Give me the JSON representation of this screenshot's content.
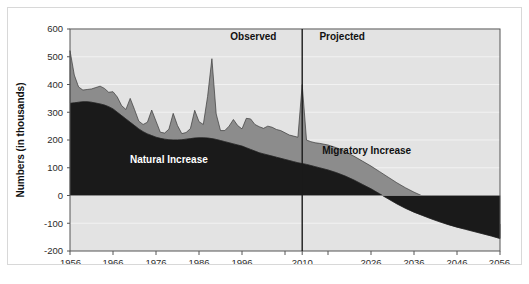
{
  "figure": {
    "caption": "",
    "y_axis_title": "Numbers (in thousands)",
    "period_labels": {
      "observed": "Observed",
      "projected": "Projected"
    },
    "series_labels": {
      "natural": "Natural Increase",
      "migratory": "Migratory Increase"
    },
    "colors": {
      "natural_fill": "#1a1a1a",
      "migratory_fill": "#8c8c8c",
      "plot_background": "#e3e3e3",
      "gridline": "#f2f2f2",
      "axis_line": "#555555",
      "divider_line": "#1a1a1a",
      "frame_border": "#d8d8d8",
      "text": "#1a1a1a",
      "natural_label_text": "#ffffff",
      "migratory_label_text": "#111111"
    }
  },
  "chart_data": {
    "type": "area",
    "stacked": true,
    "title": "",
    "xlabel": "",
    "ylabel": "Numbers (in thousands)",
    "xlim": [
      1956,
      2056
    ],
    "ylim": [
      -200,
      600
    ],
    "yticks": [
      -200,
      -100,
      0,
      100,
      200,
      300,
      400,
      500,
      600
    ],
    "ytick_labels": [
      "-200",
      "-100",
      "0",
      "100",
      "200",
      "300",
      "400",
      "500",
      "600"
    ],
    "xticks": [
      1956,
      1966,
      1976,
      1986,
      1996,
      2006,
      2010,
      2016,
      2026,
      2036,
      2046,
      2056
    ],
    "xtick_labels": [
      "1956",
      "1966",
      "1976",
      "1986",
      "1996",
      "",
      "2010",
      "",
      "2026",
      "2036",
      "2046",
      "2056"
    ],
    "grid": true,
    "legend_position": "inline-annotations",
    "divider_x": 2010,
    "annotations": [
      {
        "text": "Observed",
        "x": 2004,
        "y": 560,
        "align": "end"
      },
      {
        "text": "Projected",
        "x": 2014,
        "y": 560,
        "align": "start"
      },
      {
        "text": "Natural Increase",
        "x": 1979,
        "y": 118,
        "align": "middle"
      },
      {
        "text": "Migratory Increase",
        "x": 2025,
        "y": 148,
        "align": "middle"
      }
    ],
    "series": [
      {
        "name": "Natural Increase",
        "color": "#1a1a1a",
        "x": [
          1956,
          1957,
          1958,
          1959,
          1960,
          1961,
          1962,
          1963,
          1964,
          1965,
          1966,
          1967,
          1968,
          1969,
          1970,
          1971,
          1972,
          1973,
          1974,
          1975,
          1976,
          1977,
          1978,
          1979,
          1980,
          1981,
          1982,
          1983,
          1984,
          1985,
          1986,
          1987,
          1988,
          1989,
          1990,
          1991,
          1992,
          1993,
          1994,
          1995,
          1996,
          1997,
          1998,
          1999,
          2000,
          2001,
          2002,
          2003,
          2004,
          2005,
          2006,
          2007,
          2008,
          2009,
          2010,
          2011,
          2012,
          2013,
          2014,
          2016,
          2018,
          2020,
          2022,
          2024,
          2026,
          2028,
          2030,
          2032,
          2034,
          2036,
          2038,
          2040,
          2042,
          2044,
          2046,
          2048,
          2050,
          2052,
          2054,
          2056
        ],
        "values": [
          332,
          334,
          336,
          338,
          338,
          336,
          333,
          330,
          326,
          320,
          312,
          300,
          288,
          276,
          264,
          252,
          240,
          230,
          222,
          216,
          210,
          206,
          203,
          201,
          200,
          200,
          201,
          203,
          205,
          207,
          208,
          208,
          207,
          205,
          202,
          198,
          194,
          190,
          186,
          182,
          178,
          172,
          166,
          160,
          154,
          150,
          146,
          142,
          138,
          134,
          130,
          126,
          122,
          118,
          115,
          112,
          108,
          104,
          100,
          92,
          82,
          70,
          56,
          40,
          24,
          6,
          -12,
          -30,
          -46,
          -60,
          -72,
          -84,
          -95,
          -105,
          -114,
          -122,
          -130,
          -138,
          -146,
          -155
        ]
      },
      {
        "name": "Migratory Increase",
        "color": "#8c8c8c",
        "x": [
          1956,
          1957,
          1958,
          1959,
          1960,
          1961,
          1962,
          1963,
          1964,
          1965,
          1966,
          1967,
          1968,
          1969,
          1970,
          1971,
          1972,
          1973,
          1974,
          1975,
          1976,
          1977,
          1978,
          1979,
          1980,
          1981,
          1982,
          1983,
          1984,
          1985,
          1986,
          1987,
          1988,
          1989,
          1990,
          1991,
          1992,
          1993,
          1994,
          1995,
          1996,
          1997,
          1998,
          1999,
          2000,
          2001,
          2002,
          2003,
          2004,
          2005,
          2006,
          2007,
          2008,
          2009,
          2010,
          2011,
          2012,
          2013,
          2014,
          2016,
          2018,
          2020,
          2022,
          2024,
          2026,
          2028,
          2030,
          2032,
          2034,
          2036,
          2038,
          2040,
          2042,
          2044,
          2046,
          2048,
          2050,
          2052,
          2054,
          2056
        ],
        "values": [
          190,
          100,
          55,
          42,
          44,
          48,
          56,
          64,
          60,
          52,
          62,
          55,
          36,
          34,
          86,
          58,
          28,
          26,
          42,
          92,
          58,
          22,
          22,
          38,
          96,
          52,
          22,
          24,
          36,
          100,
          58,
          48,
          150,
          288,
          92,
          36,
          40,
          60,
          88,
          70,
          62,
          106,
          110,
          96,
          94,
          92,
          104,
          104,
          100,
          100,
          96,
          92,
          92,
          92,
          285,
          88,
          86,
          86,
          88,
          90,
          90,
          88,
          86,
          84,
          82,
          80,
          78,
          76,
          74,
          72,
          70,
          68,
          66,
          64,
          62,
          60,
          58,
          56,
          54,
          52
        ]
      }
    ]
  }
}
